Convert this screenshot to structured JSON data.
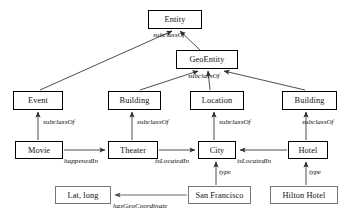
{
  "diagram": {
    "nodes": [
      {
        "id": "entity",
        "label": "Entity",
        "kind": "class",
        "x": 148,
        "y": 10,
        "w": 54,
        "h": 19
      },
      {
        "id": "geoentity",
        "label": "GeoEntity",
        "kind": "class",
        "x": 176,
        "y": 50,
        "w": 62,
        "h": 19
      },
      {
        "id": "event",
        "label": "Event",
        "kind": "class",
        "x": 13,
        "y": 91,
        "w": 50,
        "h": 19
      },
      {
        "id": "building_l",
        "label": "Building",
        "kind": "class",
        "x": 108,
        "y": 91,
        "w": 53,
        "h": 19
      },
      {
        "id": "location",
        "label": "Location",
        "kind": "class",
        "x": 190,
        "y": 91,
        "w": 54,
        "h": 19
      },
      {
        "id": "building_r",
        "label": "Building",
        "kind": "class",
        "x": 282,
        "y": 91,
        "w": 55,
        "h": 19
      },
      {
        "id": "movie",
        "label": "Movie",
        "kind": "class",
        "x": 15,
        "y": 141,
        "w": 48,
        "h": 18
      },
      {
        "id": "theater",
        "label": "Theater",
        "kind": "class",
        "x": 108,
        "y": 141,
        "w": 50,
        "h": 18
      },
      {
        "id": "city",
        "label": "City",
        "kind": "class",
        "x": 198,
        "y": 141,
        "w": 38,
        "h": 18
      },
      {
        "id": "hotel",
        "label": "Hotel",
        "kind": "class",
        "x": 288,
        "y": 141,
        "w": 40,
        "h": 18
      },
      {
        "id": "latlong",
        "label": "Lat, long",
        "kind": "instance",
        "x": 55,
        "y": 186,
        "w": 56,
        "h": 18
      },
      {
        "id": "sanfrancisco",
        "label": "San Francisco",
        "kind": "instance",
        "x": 188,
        "y": 186,
        "w": 63,
        "h": 18
      },
      {
        "id": "hiltonhotel",
        "label": "Hilton Hotel",
        "kind": "instance",
        "x": 270,
        "y": 186,
        "w": 68,
        "h": 18
      }
    ],
    "edges": [
      {
        "id": "e1",
        "from": "geoentity",
        "to": "entity",
        "label": "subclassOf",
        "lx": 153,
        "ly": 34
      },
      {
        "id": "e2",
        "from": "event",
        "to": "entity",
        "label": "",
        "lx": 0,
        "ly": 0
      },
      {
        "id": "e3",
        "from": "building_l",
        "to": "geoentity",
        "label": "",
        "lx": 0,
        "ly": 0
      },
      {
        "id": "e4",
        "from": "location",
        "to": "geoentity",
        "label": "subclassOf",
        "lx": 188,
        "ly": 76
      },
      {
        "id": "e5",
        "from": "building_r",
        "to": "geoentity",
        "label": "",
        "lx": 0,
        "ly": 0
      },
      {
        "id": "e6",
        "from": "movie",
        "to": "event",
        "label": "subclassOf",
        "lx": 43,
        "ly": 121
      },
      {
        "id": "e7",
        "from": "theater",
        "to": "building_l",
        "label": "subclassOf",
        "lx": 137,
        "ly": 121
      },
      {
        "id": "e8",
        "from": "city",
        "to": "location",
        "label": "subclassOf",
        "lx": 219,
        "ly": 121
      },
      {
        "id": "e9",
        "from": "hotel",
        "to": "building_r",
        "label": "subclassOf",
        "lx": 302,
        "ly": 121
      },
      {
        "id": "e10",
        "from": "movie",
        "to": "theater",
        "label": "happenedIn",
        "lx": 64,
        "ly": 157
      },
      {
        "id": "e11",
        "from": "theater",
        "to": "city",
        "label": "isLocatedIn",
        "lx": 158,
        "ly": 157
      },
      {
        "id": "e12",
        "from": "hotel",
        "to": "city",
        "label": "isLocatedIn",
        "lx": 238,
        "ly": 157
      },
      {
        "id": "e13",
        "from": "sanfrancisco",
        "to": "city",
        "label": "type",
        "lx": 219,
        "ly": 170
      },
      {
        "id": "e14",
        "from": "hiltonhotel",
        "to": "hotel",
        "label": "type",
        "lx": 310,
        "ly": 170
      },
      {
        "id": "e15",
        "from": "sanfrancisco",
        "to": "latlong",
        "label": "hasGeoCoordinate",
        "lx": 113,
        "ly": 203
      }
    ],
    "colors": {
      "class_border": "#000000",
      "instance_border": "#777777",
      "edge": "#3a3a3a",
      "text": "#111111",
      "background": "#ffffff"
    }
  }
}
